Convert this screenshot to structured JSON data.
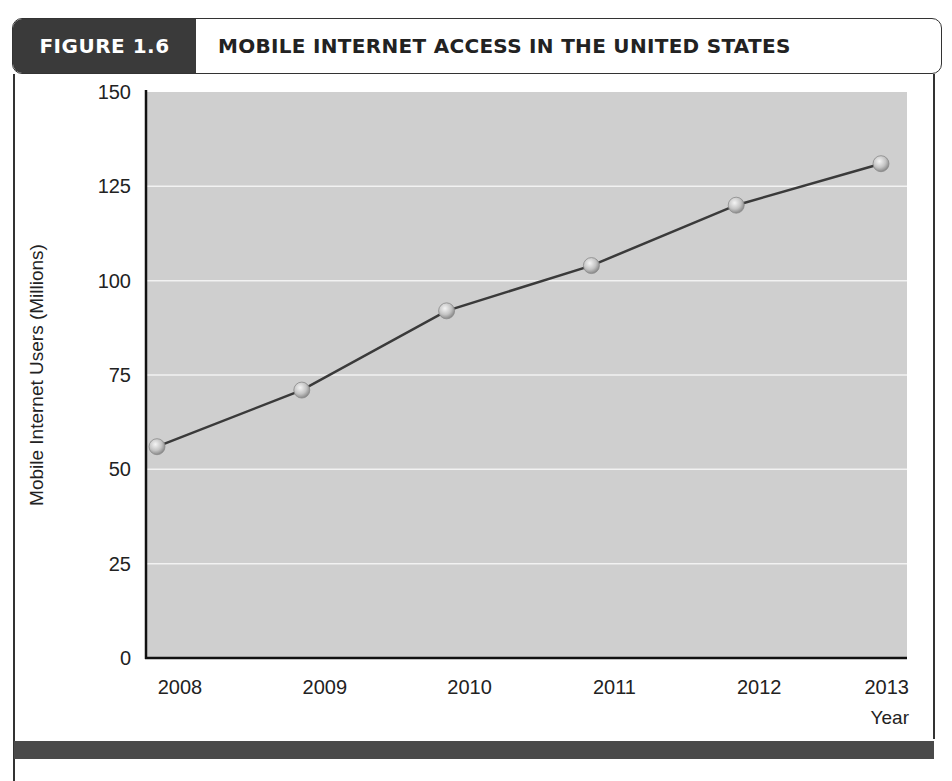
{
  "figure": {
    "label": "FIGURE 1.6",
    "title": "MOBILE INTERNET ACCESS IN THE UNITED STATES"
  },
  "colors": {
    "header_label_bg": "#3a3a3a",
    "plot_bg": "#cfcfcf",
    "gridline": "#f2f2f2",
    "line": "#3a3a3a",
    "marker": "#c8c8c8",
    "footer_bar": "#4a4a4a"
  },
  "chart_data": {
    "type": "line",
    "title": "MOBILE INTERNET ACCESS IN THE UNITED STATES",
    "xlabel": "Year",
    "ylabel": "Mobile Internet Users (Millions)",
    "x": [
      "2008",
      "2009",
      "2010",
      "2011",
      "2012",
      "2013"
    ],
    "series": [
      {
        "name": "Mobile Internet Users (Millions)",
        "values": [
          56,
          71,
          92,
          104,
          120,
          131
        ]
      }
    ],
    "yticks": [
      0,
      25,
      50,
      75,
      100,
      125,
      150
    ],
    "ylim": [
      0,
      150
    ],
    "grid": {
      "horizontal": true,
      "vertical": false
    },
    "legend": null
  }
}
